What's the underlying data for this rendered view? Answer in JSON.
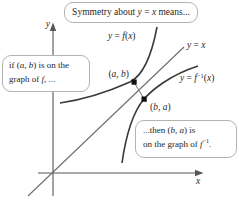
{
  "figure": {
    "title_hint": "Symmetry of a function and its inverse about y = x",
    "colors": {
      "background": "#ffffff",
      "curve": "#3a3a3a",
      "identity_line": "#6e6e6e",
      "axis": "#565656",
      "callout_border": "#b3b3b3",
      "text": "#1f1f1f",
      "point_marker": "#111111"
    },
    "axes": {
      "x_label_runs": [
        {
          "t": "x",
          "i": true
        }
      ],
      "y_label_runs": [
        {
          "t": "y",
          "i": true
        }
      ]
    },
    "curve_labels": {
      "f_runs": [
        {
          "t": "y",
          "i": true
        },
        {
          "t": " = "
        },
        {
          "t": "f",
          "i": true
        },
        {
          "t": "("
        },
        {
          "t": "x",
          "i": true
        },
        {
          "t": ")"
        }
      ],
      "identity_runs": [
        {
          "t": "y",
          "i": true
        },
        {
          "t": " = "
        },
        {
          "t": "x",
          "i": true
        }
      ],
      "f_inverse_runs": [
        {
          "t": "y",
          "i": true
        },
        {
          "t": " = "
        },
        {
          "t": "f",
          "i": true
        },
        {
          "t": "−1",
          "sup": true
        },
        {
          "t": "("
        },
        {
          "t": "x",
          "i": true
        },
        {
          "t": ")"
        }
      ]
    },
    "points": {
      "ab_label_runs": [
        {
          "t": "("
        },
        {
          "t": "a",
          "i": true
        },
        {
          "t": ", "
        },
        {
          "t": "b",
          "i": true
        },
        {
          "t": ")"
        }
      ],
      "ba_label_runs": [
        {
          "t": "("
        },
        {
          "t": "b",
          "i": true
        },
        {
          "t": ", "
        },
        {
          "t": "a",
          "i": true
        },
        {
          "t": ")"
        }
      ]
    },
    "callouts": {
      "top": {
        "runs": [
          {
            "t": "Symmetry about "
          },
          {
            "t": "y",
            "i": true
          },
          {
            "t": " = "
          },
          {
            "t": "x",
            "i": true
          },
          {
            "t": " means..."
          }
        ]
      },
      "left": {
        "line1_runs": [
          {
            "t": "if ("
          },
          {
            "t": "a",
            "i": true
          },
          {
            "t": ", "
          },
          {
            "t": "b",
            "i": true
          },
          {
            "t": ") is on the"
          }
        ],
        "line2_runs": [
          {
            "t": "graph of "
          },
          {
            "t": "f",
            "i": true
          },
          {
            "t": ", ..."
          }
        ]
      },
      "right": {
        "line1_runs": [
          {
            "t": "...then ("
          },
          {
            "t": "b",
            "i": true
          },
          {
            "t": ", "
          },
          {
            "t": "a",
            "i": true
          },
          {
            "t": ") is"
          }
        ],
        "line2_runs": [
          {
            "t": "on the graph of "
          },
          {
            "t": "f",
            "i": true
          },
          {
            "t": "−1",
            "sup": true
          },
          {
            "t": "."
          }
        ]
      }
    }
  }
}
